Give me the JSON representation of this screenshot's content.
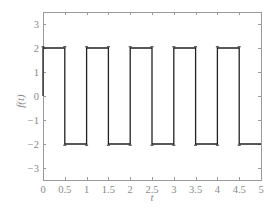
{
  "chart_data": {
    "type": "line",
    "title": "",
    "xlabel": "t",
    "ylabel": "f(t)",
    "xlim": [
      0,
      5
    ],
    "ylim": [
      -3.5,
      3.5
    ],
    "grid": false,
    "legend": null,
    "xticks": [
      0,
      0.5,
      1,
      1.5,
      2,
      2.5,
      3,
      3.5,
      4,
      4.5,
      5
    ],
    "xtick_labels": [
      "0",
      "0.5",
      "1",
      "1.5",
      "2",
      "2.5",
      "3",
      "3.5",
      "4",
      "4.5",
      "5"
    ],
    "yticks": [
      3,
      2,
      1,
      0,
      -1,
      -2,
      -3
    ],
    "ytick_labels": [
      "3",
      "2",
      "1",
      "0",
      "−1",
      "−2",
      "−3"
    ],
    "series": [
      {
        "name": "f(t) square wave",
        "color": "#222222",
        "description": "Square wave, period 1, amplitude 2; +2 on [k, k+0.5), -2 on [k+0.5, k+1), with small overshoot ears at transitions",
        "x": [
          0,
          0,
          0.5,
          0.5,
          1,
          1,
          1.5,
          1.5,
          2,
          2,
          2.5,
          2.5,
          3,
          3,
          3.5,
          3.5,
          4,
          4,
          4.5,
          4.5,
          5
        ],
        "y": [
          0,
          2,
          2,
          -2,
          -2,
          2,
          2,
          -2,
          -2,
          2,
          2,
          -2,
          -2,
          2,
          2,
          -2,
          -2,
          2,
          2,
          -2,
          -2
        ]
      }
    ]
  },
  "layout": {
    "plot_left": 43,
    "plot_right": 261,
    "plot_top": 12,
    "plot_bottom": 180,
    "axis_color": "#9a9a9a",
    "line_color": "#222222"
  }
}
